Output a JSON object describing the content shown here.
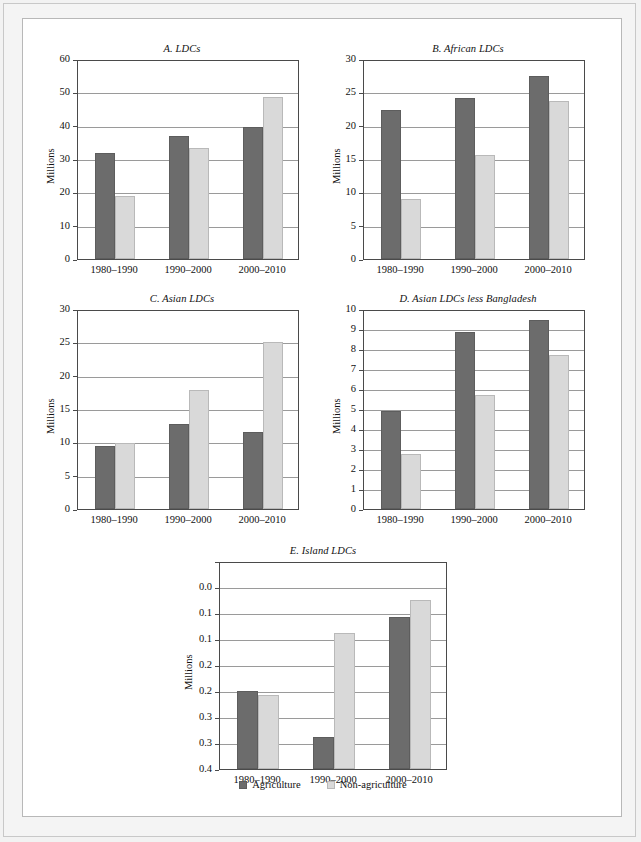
{
  "legend": {
    "agriculture_label": "Agriculture",
    "nonagriculture_label": "Non-agriculture"
  },
  "colors": {
    "agriculture": "#6c6c6c",
    "nonagriculture": "#d9d9d9",
    "axis": "#4a4a4a",
    "grid": "#9a9a9a",
    "page_background": "#f4f4f4",
    "panel_background": "#ffffff"
  },
  "chart_data": [
    {
      "id": "A",
      "type": "bar",
      "title": "A. LDCs",
      "xlabel": "",
      "ylabel": "Millions",
      "categories": [
        "1980–1990",
        "1990–2000",
        "2000–2010"
      ],
      "ylim": [
        0,
        60
      ],
      "yticks": [
        0,
        10,
        20,
        30,
        40,
        50,
        60
      ],
      "ytick_labels": [
        "0",
        "10",
        "20",
        "30",
        "40",
        "50",
        "60"
      ],
      "grid": true,
      "legend_position": "figure-bottom-center",
      "series": [
        {
          "name": "Agriculture",
          "values": [
            31.8,
            36.9,
            39.5
          ]
        },
        {
          "name": "Non-agriculture",
          "values": [
            18.9,
            33.4,
            48.6
          ]
        }
      ]
    },
    {
      "id": "B",
      "type": "bar",
      "title": "B. African LDCs",
      "xlabel": "",
      "ylabel": "Millions",
      "categories": [
        "1980–1990",
        "1990–2000",
        "2000–2010"
      ],
      "ylim": [
        0,
        30
      ],
      "yticks": [
        0,
        5,
        10,
        15,
        20,
        25,
        30
      ],
      "ytick_labels": [
        "0",
        "5",
        "10",
        "15",
        "20",
        "25",
        "30"
      ],
      "grid": true,
      "legend_position": "figure-bottom-center",
      "series": [
        {
          "name": "Agriculture",
          "values": [
            22.3,
            24.2,
            27.5
          ]
        },
        {
          "name": "Non-agriculture",
          "values": [
            9.0,
            15.6,
            23.7
          ]
        }
      ]
    },
    {
      "id": "C",
      "type": "bar",
      "title": "C. Asian LDCs",
      "xlabel": "",
      "ylabel": "Millions",
      "categories": [
        "1980–1990",
        "1990–2000",
        "2000–2010"
      ],
      "ylim": [
        0,
        30
      ],
      "yticks": [
        0,
        5,
        10,
        15,
        20,
        25,
        30
      ],
      "ytick_labels": [
        "0",
        "5",
        "10",
        "15",
        "20",
        "25",
        "30"
      ],
      "grid": true,
      "legend_position": "figure-bottom-center",
      "series": [
        {
          "name": "Agriculture",
          "values": [
            9.5,
            12.7,
            11.6
          ]
        },
        {
          "name": "Non-agriculture",
          "values": [
            9.9,
            17.8,
            25.1
          ]
        }
      ]
    },
    {
      "id": "D",
      "type": "bar",
      "title": "D. Asian LDCs less Bangladesh",
      "xlabel": "",
      "ylabel": "Millions",
      "categories": [
        "1980–1990",
        "1990–2000",
        "2000–2010"
      ],
      "ylim": [
        0,
        10
      ],
      "yticks": [
        0,
        1,
        2,
        3,
        4,
        5,
        6,
        7,
        8,
        9,
        10
      ],
      "ytick_labels": [
        "0",
        "1",
        "2",
        "3",
        "4",
        "5",
        "6",
        "7",
        "8",
        "9",
        "10"
      ],
      "grid": true,
      "legend_position": "figure-bottom-center",
      "series": [
        {
          "name": "Agriculture",
          "values": [
            4.9,
            8.85,
            9.45
          ]
        },
        {
          "name": "Non-agriculture",
          "values": [
            2.75,
            5.7,
            7.7
          ]
        }
      ]
    },
    {
      "id": "E",
      "type": "bar",
      "title": "E. Island LDCs",
      "xlabel": "",
      "ylabel": "Millions",
      "categories": [
        "1980–1990",
        "1990–2000",
        "2000–2010"
      ],
      "ylim": [
        0,
        0.4
      ],
      "yticks": [
        0,
        0.05,
        0.1,
        0.15,
        0.2,
        0.25,
        0.3,
        0.35,
        0.4
      ],
      "ytick_labels": [
        "0.0",
        "0.1",
        "0.1",
        "0.2",
        "0.2",
        "0.3",
        "0.3",
        "0.4"
      ],
      "grid": true,
      "legend_position": "figure-bottom-center",
      "series": [
        {
          "name": "Agriculture",
          "values": [
            0.15,
            0.062,
            0.292
          ]
        },
        {
          "name": "Non-agriculture",
          "values": [
            0.142,
            0.262,
            0.325
          ]
        }
      ]
    }
  ]
}
